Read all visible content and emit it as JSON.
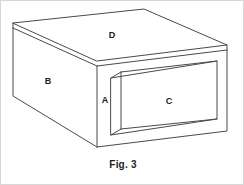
{
  "figure": {
    "caption": "Fig. 3",
    "caption_x": 0,
    "caption_y": 158,
    "background_color": "#ffffff",
    "border_color": "#d7d7d7",
    "line_color": "#4a4a4a",
    "thin_line_color": "#6a6a6a",
    "label_color": "#1c1c1c",
    "labels": [
      {
        "id": "label-d",
        "text": "D",
        "x": 111,
        "y": 35,
        "refers_to": "top-face"
      },
      {
        "id": "label-b",
        "text": "B",
        "x": 47,
        "y": 81,
        "refers_to": "left-side-face"
      },
      {
        "id": "label-a",
        "text": "A",
        "x": 104,
        "y": 100,
        "refers_to": "front-frame"
      },
      {
        "id": "label-c",
        "text": "C",
        "x": 168,
        "y": 101,
        "refers_to": "inset-front-panel"
      }
    ],
    "geometry": {
      "top_face": "M 12,22 L 143,8 L 226,44 L 96,60 Z",
      "top_slab_front": "M 12,22 L 12,27 L 96,65 L 96,60 Z",
      "top_slab_right": "M 96,60 L 226,44 L 226,49 L 96,65 Z",
      "left_face": "M 12,27 L 96,65 L 96,146 L 12,95 Z",
      "front_face": "M 96,65 L 226,49 L 226,130 L 96,146 Z",
      "inner_bevel_left": "M 110,77 L 120,71 L 120,128 L 110,134 Z",
      "inner_panel": "M 120,71 L 216,60 L 216,118 L 120,128 Z",
      "inner_panel_top_bevel": "M 110,77 L 206,66 L 216,60 L 120,71 Z"
    }
  }
}
